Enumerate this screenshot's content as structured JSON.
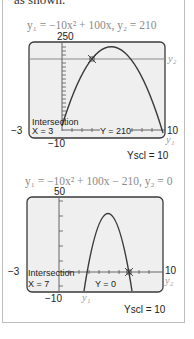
{
  "lead_text": "as shown.",
  "graphs": [
    {
      "equation": "y₁ = −10x² + 100x,  y₂ = 210",
      "ymax_label": "250",
      "xmin_label": "−3",
      "xmax_label": "10",
      "ymin_label": "−10",
      "yscl_label": "Yscl = 10",
      "y1_label": "y₁",
      "y2_label": "y₂",
      "intersection_label": "Intersection",
      "x_value": "X = 3",
      "y_value": "Y = 210"
    },
    {
      "equation": "y₁ = −10x² + 100x − 210,   y₂ = 0",
      "ymax_label": "50",
      "xmin_label": "−3",
      "xmax_label": "10",
      "ymin_label": "−10",
      "yscl_label": "Yscl = 10",
      "y1_label": "y₁",
      "y2_label": "y₂",
      "intersection_label": "Intersection",
      "x_value": "X = 7",
      "y_value": "Y = 0"
    }
  ],
  "colors": {
    "curve": "#3a3a3a",
    "screen_bg": "#efefef",
    "line2": "#8c8c8c",
    "frame": "#444444"
  }
}
